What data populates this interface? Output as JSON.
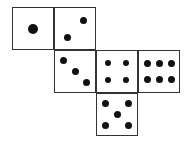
{
  "diagram": {
    "type": "cube-net",
    "faces": [
      {
        "value": 1,
        "col": 0,
        "row": 0,
        "pips": [
          [
            0.5,
            0.5,
            10
          ]
        ]
      },
      {
        "value": 2,
        "col": 1,
        "row": 0,
        "pips": [
          [
            0.7,
            0.3,
            7
          ],
          [
            0.3,
            0.72,
            7
          ]
        ]
      },
      {
        "value": 3,
        "col": 1,
        "row": 1,
        "pips": [
          [
            0.22,
            0.22,
            7
          ],
          [
            0.5,
            0.5,
            7
          ],
          [
            0.78,
            0.78,
            7
          ]
        ]
      },
      {
        "value": 4,
        "col": 2,
        "row": 1,
        "pips": [
          [
            0.28,
            0.3,
            6
          ],
          [
            0.72,
            0.3,
            6
          ],
          [
            0.28,
            0.7,
            6
          ],
          [
            0.72,
            0.7,
            6
          ]
        ]
      },
      {
        "value": 6,
        "col": 3,
        "row": 1,
        "pips": [
          [
            0.2,
            0.3,
            7
          ],
          [
            0.5,
            0.3,
            7
          ],
          [
            0.8,
            0.3,
            7
          ],
          [
            0.2,
            0.7,
            7
          ],
          [
            0.5,
            0.7,
            7
          ],
          [
            0.8,
            0.7,
            7
          ]
        ]
      },
      {
        "value": 5,
        "col": 2,
        "row": 2,
        "pips": [
          [
            0.22,
            0.24,
            7
          ],
          [
            0.78,
            0.24,
            7
          ],
          [
            0.5,
            0.5,
            7
          ],
          [
            0.22,
            0.78,
            7
          ],
          [
            0.78,
            0.78,
            7
          ]
        ]
      }
    ]
  }
}
